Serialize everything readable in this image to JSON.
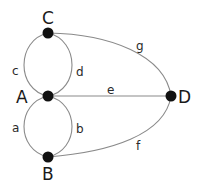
{
  "diagram": {
    "type": "graph",
    "nodes": [
      {
        "id": "C",
        "label": "C",
        "x": 48,
        "y": 33
      },
      {
        "id": "A",
        "label": "A",
        "x": 48,
        "y": 96
      },
      {
        "id": "B",
        "label": "B",
        "x": 48,
        "y": 157
      },
      {
        "id": "D",
        "label": "D",
        "x": 171,
        "y": 96
      }
    ],
    "edges": [
      {
        "id": "a",
        "label": "a",
        "from": "A",
        "to": "B"
      },
      {
        "id": "b",
        "label": "b",
        "from": "A",
        "to": "B"
      },
      {
        "id": "c",
        "label": "c",
        "from": "A",
        "to": "C"
      },
      {
        "id": "d",
        "label": "d",
        "from": "A",
        "to": "C"
      },
      {
        "id": "e",
        "label": "e",
        "from": "A",
        "to": "D"
      },
      {
        "id": "f",
        "label": "f",
        "from": "B",
        "to": "D"
      },
      {
        "id": "g",
        "label": "g",
        "from": "C",
        "to": "D"
      }
    ]
  },
  "colors": {
    "node": "#111111",
    "edge": "#8a8a8a",
    "background": "#ffffff"
  }
}
